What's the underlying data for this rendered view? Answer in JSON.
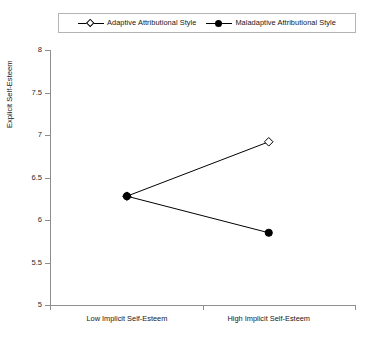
{
  "chart_data": {
    "type": "line",
    "title": "",
    "xlabel": "",
    "ylabel": "Explicit Self-Esteem",
    "categories": [
      "Low Implicit Self-Esteem",
      "High Implicit Self-Esteem"
    ],
    "ylim": [
      5,
      8
    ],
    "ytick_labels": [
      "8",
      "7.5",
      "7",
      "6.5",
      "6",
      "5.5",
      "5"
    ],
    "ytick_values": [
      8,
      7.5,
      7,
      6.5,
      6,
      5.5,
      5
    ],
    "grid": false,
    "legend_position": "top-center",
    "series": [
      {
        "name": "Adaptive Attributional Style",
        "marker": "open-diamond",
        "color": "#000000",
        "values": [
          6.28,
          6.92
        ]
      },
      {
        "name": "Maladaptive Attributional Style",
        "marker": "filled-circle",
        "color": "#000000",
        "values": [
          6.28,
          5.85
        ]
      }
    ]
  },
  "legend": {
    "entries": [
      {
        "label": "Adaptive Attributional Style",
        "marker": "open-diamond-icon"
      },
      {
        "label": "Maladaptive Attributional Style",
        "marker": "filled-circle-icon"
      }
    ]
  },
  "axes": {
    "y_title": "Explicit Self-Esteem",
    "y_ticks": [
      "8",
      "7.5",
      "7",
      "6.5",
      "6",
      "5.5",
      "5"
    ],
    "x_categories": [
      "Low Implicit Self-Esteem",
      "High Implicit Self-Esteem"
    ]
  },
  "colors": {
    "axis": "#8e8e8e",
    "data": "#000000",
    "legend_border": "#b4b4b4",
    "background": "#ffffff"
  }
}
